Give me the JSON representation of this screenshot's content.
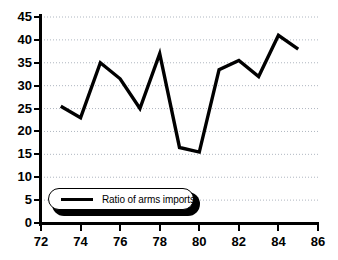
{
  "chart_data": {
    "type": "line",
    "title": "",
    "xlabel": "",
    "ylabel": "",
    "xlim": [
      72,
      86
    ],
    "ylim": [
      0,
      45
    ],
    "xticks": [
      72,
      74,
      76,
      78,
      80,
      82,
      84,
      86
    ],
    "yticks": [
      0,
      5,
      10,
      15,
      20,
      25,
      30,
      35,
      40,
      45
    ],
    "grid": true,
    "grid_axis": "y",
    "legend_position": "lower-left-inside",
    "line_color": "#000000",
    "background_color": "#ffffff",
    "series": [
      {
        "name": "Ratio of arms imports",
        "x": [
          73,
          74,
          75,
          76,
          77,
          78,
          79,
          80,
          81,
          82,
          83,
          84,
          85
        ],
        "values": [
          25.5,
          23,
          35,
          31.5,
          25,
          37,
          16.5,
          15.5,
          33.5,
          35.5,
          32,
          41,
          38
        ]
      }
    ]
  },
  "axes": {
    "y_tick_labels": [
      "45",
      "40",
      "35",
      "30",
      "25",
      "20",
      "15",
      "10",
      "5",
      "0"
    ],
    "x_tick_labels": [
      "72",
      "74",
      "76",
      "78",
      "80",
      "82",
      "84",
      "86"
    ]
  },
  "legend": {
    "label": "Ratio of arms imports"
  }
}
